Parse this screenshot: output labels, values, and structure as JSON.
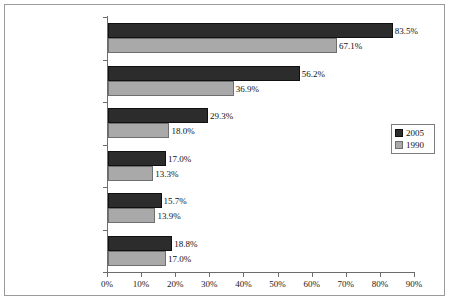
{
  "chart_data": {
    "type": "bar",
    "orientation": "horizontal",
    "title": "",
    "subtitle": "",
    "xlabel": "",
    "ylabel": "",
    "xlim": [
      0,
      90
    ],
    "grid": false,
    "legend_position": "right",
    "categories": [
      "Under age 20",
      "20-24",
      "25-29",
      "30-34",
      "35-39",
      "40+"
    ],
    "x_tick_labels": [
      "0%",
      "10%",
      "20%",
      "30%",
      "40%",
      "50%",
      "60%",
      "70%",
      "80%",
      "90%"
    ],
    "x_tick_values": [
      0,
      10,
      20,
      30,
      40,
      50,
      60,
      70,
      80,
      90
    ],
    "series": [
      {
        "name": "2005",
        "color": "#2c2c2c",
        "values": [
          83.5,
          56.2,
          29.3,
          17.0,
          15.7,
          18.8
        ],
        "labels": [
          "83.5%",
          "56.2%",
          "29.3%",
          "17.0%",
          "15.7%",
          "18.8%"
        ]
      },
      {
        "name": "1990",
        "color": "#a9a9a9",
        "values": [
          67.1,
          36.9,
          18.0,
          13.3,
          13.9,
          17.0
        ],
        "labels": [
          "67.1%",
          "36.9%",
          "18.0%",
          "13.3%",
          "13.9%",
          "17.0%"
        ]
      }
    ]
  },
  "legend": {
    "entries": [
      {
        "label": "2005",
        "swatch": "dark-swatch-icon"
      },
      {
        "label": "1990",
        "swatch": "light-swatch-icon"
      }
    ]
  }
}
